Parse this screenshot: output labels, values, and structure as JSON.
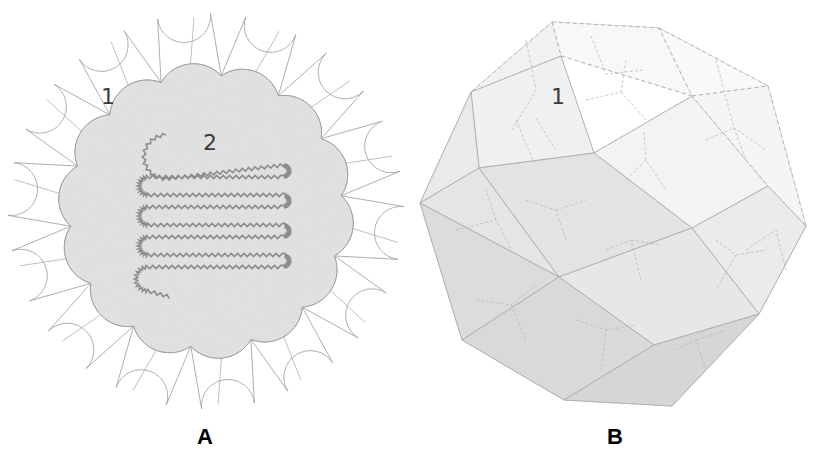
{
  "panel_a": {
    "letter": "A",
    "labels": [
      {
        "text": "1",
        "meaning": "outer capsomer shell segment"
      },
      {
        "text": "2",
        "meaning": "inner core with coiled genome"
      }
    ],
    "lobe_count": 14
  },
  "panel_b": {
    "letter": "B",
    "labels": [
      {
        "text": "1"
      }
    ]
  },
  "colors": {
    "background": "#ffffff",
    "core_fill": "#e6e6e6",
    "outline": "#9a9a9a",
    "coil": "#8c8c8c",
    "solid_light": "#f2f2f2",
    "solid_mid": "#e4e4e4",
    "solid_dark": "#d6d6d6",
    "label_text": "#3a3a3a",
    "letter_text": "#000000"
  }
}
